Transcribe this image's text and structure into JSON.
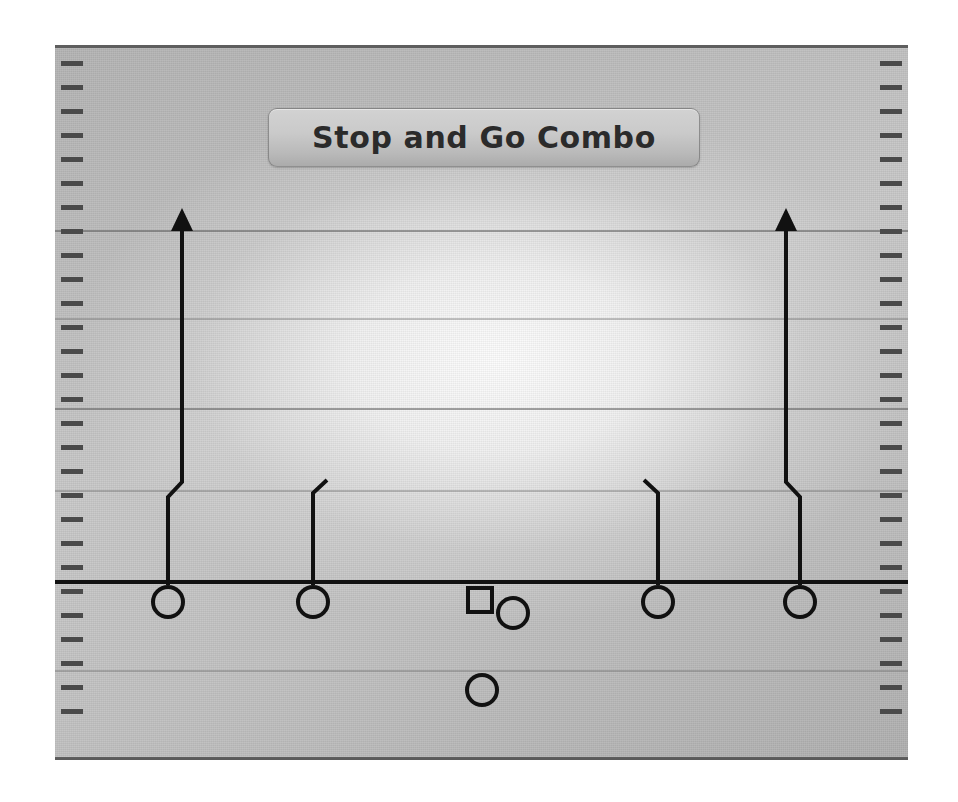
{
  "app": {
    "title": "Stop and Go Combo",
    "background_color": "#ffffff"
  },
  "field": {
    "name": "football-field-diagram",
    "surface_color": "#c0c0c0",
    "border_color": "#5e5e5e",
    "yardline_color": "#5a5a5a",
    "hashmark_color": "#4a4a4a",
    "line_of_scrimmage_color": "#111111",
    "yardlines_y": [
      185,
      273,
      363,
      445,
      535,
      625,
      713
    ],
    "line_of_scrimmage_y": 535,
    "hash_spacing": 24,
    "hash_count": 28
  },
  "title_plate": {
    "label": "Stop and Go Combo",
    "text_color": "#2b2b2b",
    "fill_top": "#d2d2d2",
    "fill_bottom": "#ababab"
  },
  "players": [
    {
      "id": "wr-left-outside",
      "role": "Outside Receiver Left",
      "marker": "circle",
      "x": 113,
      "y": 557,
      "radius": 15
    },
    {
      "id": "wr-left-inside",
      "role": "Inside Receiver Left",
      "marker": "circle",
      "x": 258,
      "y": 557,
      "radius": 15
    },
    {
      "id": "center",
      "role": "Center",
      "marker": "square",
      "x": 425,
      "y": 555,
      "size": 24
    },
    {
      "id": "quarterback",
      "role": "Quarterback",
      "marker": "circle",
      "x": 458,
      "y": 568,
      "radius": 15
    },
    {
      "id": "runningback",
      "role": "Running Back",
      "marker": "circle",
      "x": 427,
      "y": 645,
      "radius": 15
    },
    {
      "id": "wr-right-inside",
      "role": "Inside Receiver Right",
      "marker": "circle",
      "x": 603,
      "y": 557,
      "radius": 15
    },
    {
      "id": "wr-right-outside",
      "role": "Outside Receiver Right",
      "marker": "circle",
      "x": 745,
      "y": 557,
      "radius": 15
    }
  ],
  "routes": [
    {
      "id": "route-left-outside",
      "name": "Stop and Go (left outside)",
      "type": "stop-and-go",
      "has_arrowhead": true,
      "stroke_color": "#111111",
      "stroke_width": 4,
      "points": [
        [
          113,
          540
        ],
        [
          113,
          452
        ],
        [
          127,
          437
        ],
        [
          127,
          172
        ]
      ],
      "arrow_tip": [
        127,
        172
      ]
    },
    {
      "id": "route-left-inside",
      "name": "Stop / Hitch (left inside)",
      "type": "stop",
      "has_arrowhead": false,
      "stroke_color": "#111111",
      "stroke_width": 4,
      "points": [
        [
          258,
          540
        ],
        [
          258,
          448
        ],
        [
          272,
          435
        ]
      ]
    },
    {
      "id": "route-right-inside",
      "name": "Stop / Hitch (right inside)",
      "type": "stop",
      "has_arrowhead": false,
      "stroke_color": "#111111",
      "stroke_width": 4,
      "points": [
        [
          603,
          540
        ],
        [
          603,
          448
        ],
        [
          589,
          435
        ]
      ]
    },
    {
      "id": "route-right-outside",
      "name": "Stop and Go (right outside)",
      "type": "stop-and-go",
      "has_arrowhead": true,
      "stroke_color": "#111111",
      "stroke_width": 4,
      "points": [
        [
          745,
          540
        ],
        [
          745,
          452
        ],
        [
          731,
          437
        ],
        [
          731,
          172
        ]
      ],
      "arrow_tip": [
        731,
        172
      ]
    }
  ]
}
